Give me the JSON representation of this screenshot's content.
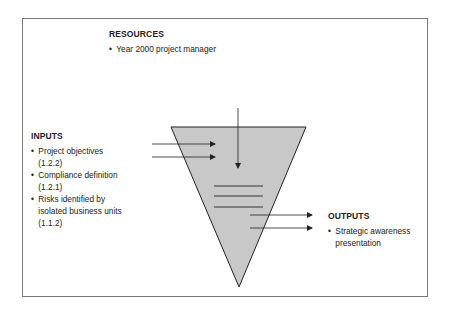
{
  "resources": {
    "heading": "RESOURCES",
    "items": [
      "Year 2000 project manager"
    ]
  },
  "inputs": {
    "heading": "INPUTS",
    "items": [
      {
        "text": "Project objectives",
        "ref": "(1.2.2)"
      },
      {
        "text": "Compliance definition",
        "ref": "(1.2.1)"
      },
      {
        "text": "Risks identified by",
        "text2": "isolated business units",
        "ref": "(1.1.2)"
      }
    ]
  },
  "outputs": {
    "heading": "OUTPUTS",
    "items": [
      {
        "text": "Strategic awareness",
        "text2": "presentation"
      }
    ]
  },
  "colors": {
    "funnel_fill": "#c8c8c8",
    "stroke": "#222222",
    "frame": "#777777"
  }
}
